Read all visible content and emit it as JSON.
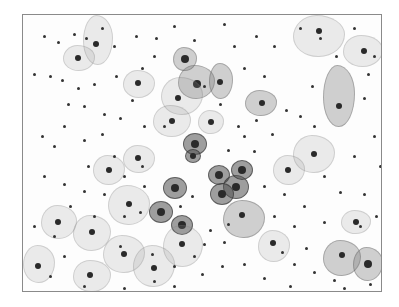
{
  "image": {
    "description": "Grayscale cytology smear micrograph showing squamous epithelial cells with dark nuclei and scattered small dark inflammatory cells/debris, inside a thin gray frame",
    "frame": {
      "x": 22,
      "y": 14,
      "w": 358,
      "h": 276,
      "border_color": "#8a8a8a"
    },
    "cells": [
      {
        "x": 60,
        "y": 0,
        "w": 28,
        "h": 48,
        "tone": "pale",
        "nx": 12,
        "ny": 28,
        "nr": 3
      },
      {
        "x": 40,
        "y": 30,
        "w": 30,
        "h": 24,
        "tone": "pale",
        "nx": 14,
        "ny": 12,
        "nr": 3
      },
      {
        "x": 155,
        "y": 50,
        "w": 35,
        "h": 32,
        "tone": "mid",
        "nx": 18,
        "ny": 18,
        "nr": 4
      },
      {
        "x": 138,
        "y": 62,
        "w": 40,
        "h": 36,
        "tone": "pale",
        "nx": 16,
        "ny": 20,
        "nr": 3
      },
      {
        "x": 150,
        "y": 32,
        "w": 22,
        "h": 22,
        "tone": "mid",
        "nx": 11,
        "ny": 11,
        "nr": 4
      },
      {
        "x": 186,
        "y": 48,
        "w": 22,
        "h": 34,
        "tone": "mid",
        "nx": 10,
        "ny": 18,
        "nr": 3
      },
      {
        "x": 222,
        "y": 75,
        "w": 30,
        "h": 24,
        "tone": "mid",
        "nx": 16,
        "ny": 12,
        "nr": 3
      },
      {
        "x": 160,
        "y": 118,
        "w": 22,
        "h": 20,
        "tone": "dark",
        "nx": 11,
        "ny": 10,
        "nr": 4
      },
      {
        "x": 162,
        "y": 134,
        "w": 14,
        "h": 12,
        "tone": "dark",
        "nx": 7,
        "ny": 6,
        "nr": 3
      },
      {
        "x": 130,
        "y": 90,
        "w": 36,
        "h": 30,
        "tone": "pale",
        "nx": 18,
        "ny": 15,
        "nr": 3
      },
      {
        "x": 100,
        "y": 55,
        "w": 30,
        "h": 26,
        "tone": "pale",
        "nx": 14,
        "ny": 12,
        "nr": 3
      },
      {
        "x": 270,
        "y": 0,
        "w": 50,
        "h": 40,
        "tone": "pale",
        "nx": 25,
        "ny": 15,
        "nr": 3
      },
      {
        "x": 300,
        "y": 50,
        "w": 30,
        "h": 60,
        "tone": "mid",
        "nx": 15,
        "ny": 40,
        "nr": 3
      },
      {
        "x": 320,
        "y": 20,
        "w": 38,
        "h": 30,
        "tone": "pale",
        "nx": 20,
        "ny": 15,
        "nr": 3
      },
      {
        "x": 185,
        "y": 150,
        "w": 20,
        "h": 18,
        "tone": "dark",
        "nx": 10,
        "ny": 9,
        "nr": 4
      },
      {
        "x": 200,
        "y": 160,
        "w": 24,
        "h": 22,
        "tone": "dark",
        "nx": 12,
        "ny": 11,
        "nr": 4
      },
      {
        "x": 187,
        "y": 168,
        "w": 22,
        "h": 20,
        "tone": "dark",
        "nx": 11,
        "ny": 10,
        "nr": 4
      },
      {
        "x": 208,
        "y": 145,
        "w": 20,
        "h": 18,
        "tone": "dark",
        "nx": 10,
        "ny": 9,
        "nr": 4
      },
      {
        "x": 140,
        "y": 162,
        "w": 22,
        "h": 20,
        "tone": "dark",
        "nx": 11,
        "ny": 10,
        "nr": 4
      },
      {
        "x": 126,
        "y": 186,
        "w": 22,
        "h": 20,
        "tone": "dark",
        "nx": 11,
        "ny": 10,
        "nr": 4
      },
      {
        "x": 148,
        "y": 200,
        "w": 20,
        "h": 18,
        "tone": "dark",
        "nx": 10,
        "ny": 9,
        "nr": 4
      },
      {
        "x": 200,
        "y": 185,
        "w": 40,
        "h": 36,
        "tone": "mid",
        "nx": 18,
        "ny": 14,
        "nr": 3
      },
      {
        "x": 85,
        "y": 170,
        "w": 40,
        "h": 38,
        "tone": "pale",
        "nx": 20,
        "ny": 18,
        "nr": 3
      },
      {
        "x": 50,
        "y": 200,
        "w": 36,
        "h": 34,
        "tone": "pale",
        "nx": 18,
        "ny": 16,
        "nr": 3
      },
      {
        "x": 18,
        "y": 190,
        "w": 34,
        "h": 32,
        "tone": "pale",
        "nx": 16,
        "ny": 16,
        "nr": 3
      },
      {
        "x": 80,
        "y": 220,
        "w": 40,
        "h": 36,
        "tone": "pale",
        "nx": 20,
        "ny": 18,
        "nr": 3
      },
      {
        "x": 110,
        "y": 230,
        "w": 40,
        "h": 40,
        "tone": "pale",
        "nx": 20,
        "ny": 22,
        "nr": 3
      },
      {
        "x": 140,
        "y": 210,
        "w": 38,
        "h": 40,
        "tone": "pale",
        "nx": 18,
        "ny": 18,
        "nr": 3
      },
      {
        "x": 0,
        "y": 230,
        "w": 30,
        "h": 36,
        "tone": "pale",
        "nx": 14,
        "ny": 20,
        "nr": 3
      },
      {
        "x": 50,
        "y": 245,
        "w": 36,
        "h": 30,
        "tone": "pale",
        "nx": 16,
        "ny": 14,
        "nr": 3
      },
      {
        "x": 235,
        "y": 215,
        "w": 30,
        "h": 30,
        "tone": "pale",
        "nx": 14,
        "ny": 12,
        "nr": 3
      },
      {
        "x": 300,
        "y": 225,
        "w": 36,
        "h": 34,
        "tone": "mid",
        "nx": 18,
        "ny": 14,
        "nr": 3
      },
      {
        "x": 330,
        "y": 232,
        "w": 28,
        "h": 32,
        "tone": "mid",
        "nx": 14,
        "ny": 16,
        "nr": 4
      },
      {
        "x": 318,
        "y": 195,
        "w": 28,
        "h": 22,
        "tone": "pale",
        "nx": 14,
        "ny": 11,
        "nr": 3
      },
      {
        "x": 270,
        "y": 120,
        "w": 40,
        "h": 36,
        "tone": "pale",
        "nx": 20,
        "ny": 18,
        "nr": 3
      },
      {
        "x": 250,
        "y": 140,
        "w": 30,
        "h": 28,
        "tone": "pale",
        "nx": 14,
        "ny": 14,
        "nr": 3
      },
      {
        "x": 175,
        "y": 95,
        "w": 24,
        "h": 22,
        "tone": "pale",
        "nx": 12,
        "ny": 11,
        "nr": 3
      },
      {
        "x": 70,
        "y": 140,
        "w": 30,
        "h": 28,
        "tone": "pale",
        "nx": 15,
        "ny": 14,
        "nr": 3
      },
      {
        "x": 100,
        "y": 130,
        "w": 30,
        "h": 26,
        "tone": "pale",
        "nx": 14,
        "ny": 12,
        "nr": 3
      }
    ],
    "dots": [
      [
        20,
        20
      ],
      [
        34,
        26
      ],
      [
        50,
        18
      ],
      [
        62,
        22
      ],
      [
        78,
        12
      ],
      [
        90,
        30
      ],
      [
        112,
        20
      ],
      [
        132,
        22
      ],
      [
        150,
        10
      ],
      [
        170,
        24
      ],
      [
        200,
        8
      ],
      [
        232,
        20
      ],
      [
        250,
        30
      ],
      [
        276,
        12
      ],
      [
        296,
        22
      ],
      [
        330,
        12
      ],
      [
        350,
        40
      ],
      [
        344,
        58
      ],
      [
        10,
        58
      ],
      [
        26,
        60
      ],
      [
        38,
        64
      ],
      [
        54,
        72
      ],
      [
        70,
        68
      ],
      [
        60,
        90
      ],
      [
        80,
        98
      ],
      [
        96,
        102
      ],
      [
        108,
        84
      ],
      [
        40,
        110
      ],
      [
        18,
        120
      ],
      [
        30,
        130
      ],
      [
        60,
        124
      ],
      [
        78,
        118
      ],
      [
        120,
        110
      ],
      [
        140,
        110
      ],
      [
        180,
        70
      ],
      [
        196,
        88
      ],
      [
        214,
        110
      ],
      [
        232,
        104
      ],
      [
        248,
        118
      ],
      [
        262,
        94
      ],
      [
        288,
        70
      ],
      [
        312,
        40
      ],
      [
        340,
        82
      ],
      [
        350,
        120
      ],
      [
        330,
        140
      ],
      [
        300,
        160
      ],
      [
        316,
        176
      ],
      [
        340,
        178
      ],
      [
        352,
        200
      ],
      [
        280,
        190
      ],
      [
        260,
        178
      ],
      [
        240,
        170
      ],
      [
        230,
        135
      ],
      [
        118,
        150
      ],
      [
        100,
        160
      ],
      [
        80,
        178
      ],
      [
        60,
        175
      ],
      [
        40,
        168
      ],
      [
        20,
        160
      ],
      [
        10,
        210
      ],
      [
        30,
        220
      ],
      [
        40,
        240
      ],
      [
        26,
        260
      ],
      [
        60,
        270
      ],
      [
        100,
        272
      ],
      [
        130,
        265
      ],
      [
        150,
        270
      ],
      [
        178,
        258
      ],
      [
        198,
        250
      ],
      [
        220,
        248
      ],
      [
        240,
        262
      ],
      [
        266,
        270
      ],
      [
        290,
        256
      ],
      [
        310,
        264
      ],
      [
        320,
        272
      ],
      [
        346,
        268
      ],
      [
        180,
        228
      ],
      [
        200,
        226
      ],
      [
        168,
        180
      ],
      [
        156,
        190
      ],
      [
        116,
        196
      ],
      [
        100,
        200
      ],
      [
        250,
        200
      ],
      [
        270,
        210
      ],
      [
        282,
        232
      ],
      [
        220,
        120
      ],
      [
        204,
        134
      ],
      [
        120,
        170
      ],
      [
        90,
        140
      ],
      [
        64,
        150
      ],
      [
        46,
        190
      ],
      [
        70,
        200
      ],
      [
        96,
        230
      ],
      [
        128,
        238
      ],
      [
        150,
        250
      ],
      [
        170,
        240
      ],
      [
        186,
        214
      ],
      [
        204,
        208
      ],
      [
        258,
        236
      ],
      [
        270,
        248
      ],
      [
        300,
        206
      ],
      [
        336,
        210
      ],
      [
        356,
        150
      ],
      [
        290,
        110
      ],
      [
        276,
        100
      ],
      [
        210,
        30
      ],
      [
        220,
        52
      ],
      [
        240,
        60
      ],
      [
        130,
        40
      ],
      [
        118,
        52
      ],
      [
        92,
        60
      ],
      [
        44,
        88
      ]
    ]
  }
}
